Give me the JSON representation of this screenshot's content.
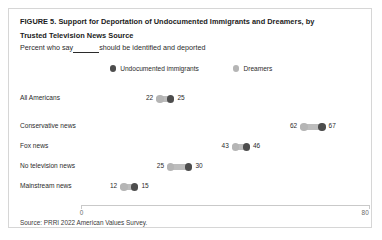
{
  "figure": {
    "title_lines": [
      "FIGURE 5.  Support for Deportation of Undocumented Immigrants and Dreamers, by",
      "Trusted Television News Source"
    ],
    "subtitle_prefix": "Percent who say",
    "subtitle_suffix": "should be identified and deported",
    "source": "Source: PRRI 2022 American Values Survey."
  },
  "legend": {
    "position": "top-center",
    "items": [
      {
        "label": "Undocumented immigrants",
        "color": "#4d4d4d",
        "icon": "circle-marker-icon"
      },
      {
        "label": "Dreamers",
        "color": "#b5b5b5",
        "icon": "circle-marker-icon"
      }
    ]
  },
  "axis": {
    "min_label": "0",
    "max_label": "80",
    "min": 0,
    "max": 80
  },
  "colors": {
    "undocumented": "#4d4d4d",
    "dreamers": "#b5b5b5",
    "connector": "#bdbdbd",
    "axis": "#c9c9c9",
    "border": "#d6d6d6",
    "text": "#2b2b2b"
  },
  "chart_data": {
    "type": "scatter",
    "title": "FIGURE 5.  Support for Deportation of Undocumented Immigrants and Dreamers, by Trusted Television News Source",
    "subtitle": "Percent who say_____should be identified and deported",
    "xlabel": "",
    "ylabel": "",
    "xlim": [
      0,
      80
    ],
    "grid": false,
    "legend_position": "top-center",
    "categories": [
      "All Americans",
      "Conservative news",
      "Fox news",
      "No television news",
      "Mainstream news"
    ],
    "series": [
      {
        "name": "Undocumented immigrants",
        "color": "#4d4d4d",
        "values": [
          25,
          67,
          46,
          30,
          15
        ]
      },
      {
        "name": "Dreamers",
        "color": "#b5b5b5",
        "values": [
          22,
          62,
          43,
          25,
          12
        ]
      }
    ],
    "rows": [
      {
        "label": "All Americans",
        "dreamers": 22,
        "undocumented": 25,
        "group": "overall"
      },
      {
        "label": "Conservative news",
        "dreamers": 62,
        "undocumented": 67,
        "group": "news-source"
      },
      {
        "label": "Fox news",
        "dreamers": 43,
        "undocumented": 46,
        "group": "news-source"
      },
      {
        "label": "No television news",
        "dreamers": 25,
        "undocumented": 30,
        "group": "news-source"
      },
      {
        "label": "Mainstream news",
        "dreamers": 12,
        "undocumented": 15,
        "group": "news-source"
      }
    ]
  }
}
